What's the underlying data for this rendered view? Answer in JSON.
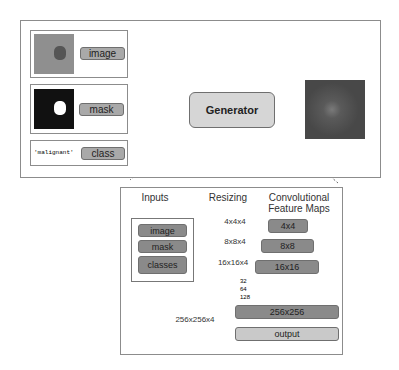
{
  "top": {
    "inputs": [
      {
        "label": "image",
        "kind": "image-thumb"
      },
      {
        "label": "mask",
        "kind": "mask-thumb"
      },
      {
        "label": "class",
        "kind": "text",
        "text": "'malignant'"
      }
    ],
    "generator": "Generator",
    "output_kind": "generated-image"
  },
  "detail": {
    "headers": {
      "inputs": "Inputs",
      "resizing": "Resizing",
      "conv1": "Convolutional",
      "conv2": "Feature Maps"
    },
    "inputs": [
      "image",
      "mask",
      "classes"
    ],
    "resize_labels": [
      "4x4x4",
      "8x8x4",
      "16x16x4",
      "256x256x4"
    ],
    "feature_maps": [
      "4x4",
      "8x8",
      "16x16",
      "256x256",
      "output"
    ],
    "channels": [
      "32",
      "64",
      "128"
    ]
  },
  "colors": {
    "pill": "#a9a9a9",
    "dark_pill": "#8a8a8a",
    "light_pill": "#c9c9c9",
    "generator": "#d6d6d6"
  }
}
